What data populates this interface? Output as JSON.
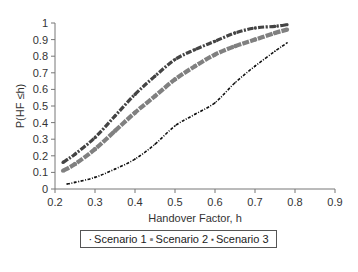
{
  "chart_data": {
    "type": "scatter",
    "title": "",
    "xlabel": "Handover Factor, h",
    "ylabel": "P(HF ≤h)",
    "xlim": [
      0.2,
      0.9
    ],
    "ylim": [
      0,
      1
    ],
    "xticks": [
      "0.2",
      "0.3",
      "0.4",
      "0.5",
      "0.6",
      "0.7",
      "0.8",
      "0.9"
    ],
    "yticks": [
      "0",
      "0.1",
      "0.2",
      "0.3",
      "0.4",
      "0.5",
      "0.6",
      "0.7",
      "0.8",
      "0.9",
      "1"
    ],
    "grid": false,
    "legend_position": "bottom",
    "series": [
      {
        "name": "Scenario 1",
        "color": "#111111",
        "marker": "small-dot",
        "x": [
          0.23,
          0.25,
          0.3,
          0.35,
          0.4,
          0.45,
          0.5,
          0.55,
          0.6,
          0.65,
          0.7,
          0.75,
          0.78
        ],
        "y": [
          0.03,
          0.04,
          0.07,
          0.12,
          0.18,
          0.27,
          0.38,
          0.45,
          0.52,
          0.64,
          0.74,
          0.83,
          0.88
        ]
      },
      {
        "name": "Scenario 2",
        "color": "#808080",
        "marker": "square",
        "x": [
          0.22,
          0.25,
          0.3,
          0.35,
          0.4,
          0.45,
          0.5,
          0.55,
          0.6,
          0.65,
          0.7,
          0.75,
          0.78
        ],
        "y": [
          0.11,
          0.15,
          0.24,
          0.35,
          0.46,
          0.56,
          0.66,
          0.74,
          0.81,
          0.86,
          0.9,
          0.94,
          0.96
        ]
      },
      {
        "name": "Scenario 3",
        "color": "#444444",
        "marker": "diamond",
        "x": [
          0.22,
          0.25,
          0.3,
          0.35,
          0.4,
          0.45,
          0.5,
          0.55,
          0.6,
          0.65,
          0.7,
          0.75,
          0.78
        ],
        "y": [
          0.16,
          0.21,
          0.31,
          0.44,
          0.57,
          0.68,
          0.78,
          0.84,
          0.89,
          0.94,
          0.97,
          0.98,
          0.99
        ]
      }
    ]
  },
  "legend": {
    "items": [
      {
        "label": "Scenario 1",
        "marker_glyph": "·"
      },
      {
        "label": "Scenario 2",
        "marker_glyph": "▪"
      },
      {
        "label": "Scenario 3",
        "marker_glyph": "▪"
      }
    ]
  }
}
